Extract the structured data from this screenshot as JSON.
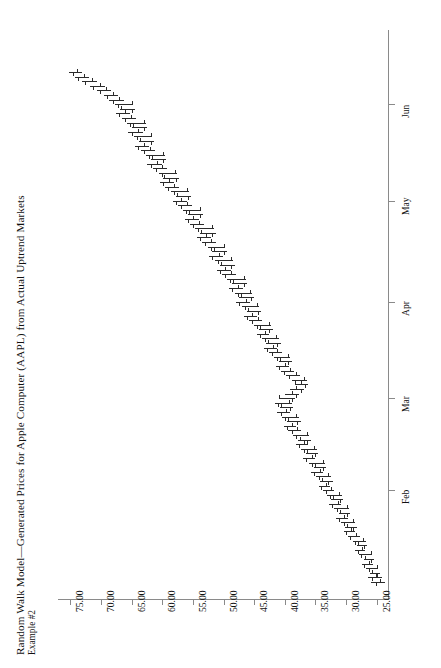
{
  "chart_data": {
    "type": "ohlc",
    "title": "Random Walk Model—Generated Prices for Apple Computer (AAPL) from Actual Uptrend Markets",
    "subtitle": "Example #2",
    "orientation": "rotated-90-ccw",
    "xlabel": "",
    "ylabel": "",
    "grid": false,
    "legend": null,
    "price_axis": {
      "ticks": [
        75.0,
        70.0,
        65.0,
        60.0,
        55.0,
        50.0,
        45.0,
        40.0,
        35.0,
        30.0,
        25.0
      ],
      "tick_labels": [
        "75.00",
        "70.00",
        "65.00",
        "60.00",
        "55.00",
        "50.00",
        "45.00",
        "40.00",
        "35.00",
        "30.00",
        "25.00"
      ],
      "min": 23.0,
      "max": 77.0,
      "format": "0.00"
    },
    "time_axis": {
      "tick_labels": [
        "Feb",
        "Mar",
        "Apr",
        "May",
        "Jun"
      ],
      "tick_index": [
        20,
        40,
        61,
        83,
        104
      ],
      "n_bars": 112
    },
    "bars": [
      {
        "i": 0,
        "h": 25.9,
        "l": 23.6,
        "o": 24.4,
        "c": 25.2
      },
      {
        "i": 1,
        "h": 26.4,
        "l": 24.2,
        "o": 25.1,
        "c": 25.8
      },
      {
        "i": 2,
        "h": 26.1,
        "l": 24.5,
        "o": 25.7,
        "c": 24.9
      },
      {
        "i": 3,
        "h": 26.8,
        "l": 24.8,
        "o": 25.0,
        "c": 26.3
      },
      {
        "i": 4,
        "h": 27.4,
        "l": 25.6,
        "o": 26.2,
        "c": 27.0
      },
      {
        "i": 5,
        "h": 27.1,
        "l": 25.4,
        "o": 26.9,
        "c": 25.9
      },
      {
        "i": 6,
        "h": 27.9,
        "l": 25.7,
        "o": 26.0,
        "c": 27.5
      },
      {
        "i": 7,
        "h": 28.6,
        "l": 26.9,
        "o": 27.4,
        "c": 28.1
      },
      {
        "i": 8,
        "h": 28.3,
        "l": 26.6,
        "o": 28.0,
        "c": 27.1
      },
      {
        "i": 9,
        "h": 28.9,
        "l": 26.8,
        "o": 27.2,
        "c": 28.5
      },
      {
        "i": 10,
        "h": 29.7,
        "l": 27.8,
        "o": 28.4,
        "c": 29.3
      },
      {
        "i": 11,
        "h": 30.4,
        "l": 28.6,
        "o": 29.2,
        "c": 30.0
      },
      {
        "i": 12,
        "h": 30.1,
        "l": 28.3,
        "o": 29.9,
        "c": 28.8
      },
      {
        "i": 13,
        "h": 30.9,
        "l": 28.5,
        "o": 28.9,
        "c": 30.4
      },
      {
        "i": 14,
        "h": 31.6,
        "l": 29.7,
        "o": 30.3,
        "c": 31.2
      },
      {
        "i": 15,
        "h": 31.2,
        "l": 29.3,
        "o": 31.0,
        "c": 29.8
      },
      {
        "i": 16,
        "h": 32.0,
        "l": 29.5,
        "o": 29.9,
        "c": 31.5
      },
      {
        "i": 17,
        "h": 32.8,
        "l": 30.9,
        "o": 31.4,
        "c": 32.3
      },
      {
        "i": 18,
        "h": 32.4,
        "l": 30.5,
        "o": 32.2,
        "c": 31.0
      },
      {
        "i": 19,
        "h": 33.1,
        "l": 30.7,
        "o": 31.1,
        "c": 32.6
      },
      {
        "i": 20,
        "h": 33.8,
        "l": 31.9,
        "o": 32.5,
        "c": 33.3
      },
      {
        "i": 21,
        "h": 34.5,
        "l": 32.6,
        "o": 33.2,
        "c": 34.1
      },
      {
        "i": 22,
        "h": 34.2,
        "l": 32.2,
        "o": 34.0,
        "c": 32.9
      },
      {
        "i": 23,
        "h": 34.9,
        "l": 32.4,
        "o": 33.0,
        "c": 34.4
      },
      {
        "i": 24,
        "h": 35.7,
        "l": 33.7,
        "o": 34.3,
        "c": 35.2
      },
      {
        "i": 25,
        "h": 35.3,
        "l": 33.2,
        "o": 35.1,
        "c": 33.7
      },
      {
        "i": 26,
        "h": 36.1,
        "l": 33.4,
        "o": 33.8,
        "c": 35.6
      },
      {
        "i": 27,
        "h": 37.0,
        "l": 35.0,
        "o": 35.5,
        "c": 36.5
      },
      {
        "i": 28,
        "h": 36.6,
        "l": 34.5,
        "o": 36.4,
        "c": 35.1
      },
      {
        "i": 29,
        "h": 37.4,
        "l": 34.8,
        "o": 35.2,
        "c": 36.9
      },
      {
        "i": 30,
        "h": 38.2,
        "l": 36.2,
        "o": 36.8,
        "c": 37.7
      },
      {
        "i": 31,
        "h": 37.8,
        "l": 35.7,
        "o": 37.6,
        "c": 36.3
      },
      {
        "i": 32,
        "h": 38.6,
        "l": 36.0,
        "o": 36.4,
        "c": 38.1
      },
      {
        "i": 33,
        "h": 39.4,
        "l": 37.4,
        "o": 38.0,
        "c": 38.9
      },
      {
        "i": 34,
        "h": 40.1,
        "l": 38.1,
        "o": 38.8,
        "c": 39.6
      },
      {
        "i": 35,
        "h": 39.6,
        "l": 37.4,
        "o": 39.4,
        "c": 38.0
      },
      {
        "i": 36,
        "h": 40.4,
        "l": 37.7,
        "o": 38.1,
        "c": 39.9
      },
      {
        "i": 37,
        "h": 41.2,
        "l": 39.2,
        "o": 39.8,
        "c": 40.7
      },
      {
        "i": 38,
        "h": 40.8,
        "l": 38.6,
        "o": 40.6,
        "c": 39.2
      },
      {
        "i": 39,
        "h": 41.6,
        "l": 38.9,
        "o": 39.3,
        "c": 41.1
      },
      {
        "i": 40,
        "h": 40.9,
        "l": 38.4,
        "o": 41.0,
        "c": 38.9
      },
      {
        "i": 41,
        "h": 40.0,
        "l": 37.6,
        "o": 38.8,
        "c": 38.2
      },
      {
        "i": 42,
        "h": 39.2,
        "l": 36.9,
        "o": 38.1,
        "c": 37.4
      },
      {
        "i": 43,
        "h": 38.4,
        "l": 36.2,
        "o": 37.3,
        "c": 36.7
      },
      {
        "i": 44,
        "h": 38.9,
        "l": 36.4,
        "o": 36.8,
        "c": 38.3
      },
      {
        "i": 45,
        "h": 39.8,
        "l": 37.6,
        "o": 38.2,
        "c": 39.3
      },
      {
        "i": 46,
        "h": 40.6,
        "l": 38.5,
        "o": 39.2,
        "c": 40.1
      },
      {
        "i": 47,
        "h": 41.4,
        "l": 39.3,
        "o": 40.0,
        "c": 40.9
      },
      {
        "i": 48,
        "h": 41.0,
        "l": 38.8,
        "o": 40.8,
        "c": 39.4
      },
      {
        "i": 49,
        "h": 41.8,
        "l": 39.1,
        "o": 39.5,
        "c": 41.3
      },
      {
        "i": 50,
        "h": 42.6,
        "l": 40.5,
        "o": 41.2,
        "c": 42.1
      },
      {
        "i": 51,
        "h": 43.4,
        "l": 41.3,
        "o": 42.0,
        "c": 42.9
      },
      {
        "i": 52,
        "h": 43.0,
        "l": 40.7,
        "o": 42.8,
        "c": 41.3
      },
      {
        "i": 53,
        "h": 43.8,
        "l": 41.0,
        "o": 41.4,
        "c": 43.3
      },
      {
        "i": 54,
        "h": 44.6,
        "l": 42.5,
        "o": 43.2,
        "c": 44.1
      },
      {
        "i": 55,
        "h": 44.2,
        "l": 41.9,
        "o": 44.0,
        "c": 42.5
      },
      {
        "i": 56,
        "h": 45.0,
        "l": 42.2,
        "o": 42.6,
        "c": 44.5
      },
      {
        "i": 57,
        "h": 45.9,
        "l": 43.7,
        "o": 44.4,
        "c": 45.4
      },
      {
        "i": 58,
        "h": 46.7,
        "l": 44.5,
        "o": 45.3,
        "c": 46.2
      },
      {
        "i": 59,
        "h": 46.2,
        "l": 43.9,
        "o": 46.0,
        "c": 44.4
      },
      {
        "i": 60,
        "h": 47.0,
        "l": 44.2,
        "o": 44.5,
        "c": 46.5
      },
      {
        "i": 61,
        "h": 47.9,
        "l": 45.7,
        "o": 46.4,
        "c": 47.4
      },
      {
        "i": 62,
        "h": 47.4,
        "l": 45.0,
        "o": 47.2,
        "c": 45.5
      },
      {
        "i": 63,
        "h": 48.2,
        "l": 45.3,
        "o": 45.6,
        "c": 47.7
      },
      {
        "i": 64,
        "h": 49.1,
        "l": 46.8,
        "o": 47.6,
        "c": 48.6
      },
      {
        "i": 65,
        "h": 48.6,
        "l": 46.1,
        "o": 48.4,
        "c": 46.6
      },
      {
        "i": 66,
        "h": 49.4,
        "l": 46.4,
        "o": 46.7,
        "c": 48.9
      },
      {
        "i": 67,
        "h": 50.3,
        "l": 48.0,
        "o": 48.8,
        "c": 49.8
      },
      {
        "i": 68,
        "h": 51.1,
        "l": 48.8,
        "o": 49.7,
        "c": 50.6
      },
      {
        "i": 69,
        "h": 50.6,
        "l": 48.2,
        "o": 50.4,
        "c": 48.7
      },
      {
        "i": 70,
        "h": 51.4,
        "l": 48.5,
        "o": 48.8,
        "c": 50.9
      },
      {
        "i": 71,
        "h": 52.3,
        "l": 50.0,
        "o": 50.8,
        "c": 51.8
      },
      {
        "i": 72,
        "h": 51.8,
        "l": 49.4,
        "o": 51.6,
        "c": 49.9
      },
      {
        "i": 73,
        "h": 52.6,
        "l": 49.7,
        "o": 50.0,
        "c": 52.1
      },
      {
        "i": 74,
        "h": 53.5,
        "l": 51.2,
        "o": 52.0,
        "c": 53.0
      },
      {
        "i": 75,
        "h": 54.3,
        "l": 52.0,
        "o": 52.9,
        "c": 53.8
      },
      {
        "i": 76,
        "h": 53.8,
        "l": 51.3,
        "o": 53.6,
        "c": 51.8
      },
      {
        "i": 77,
        "h": 54.6,
        "l": 51.6,
        "o": 51.9,
        "c": 54.1
      },
      {
        "i": 78,
        "h": 55.5,
        "l": 53.2,
        "o": 54.0,
        "c": 55.0
      },
      {
        "i": 79,
        "h": 56.3,
        "l": 54.0,
        "o": 54.9,
        "c": 55.8
      },
      {
        "i": 80,
        "h": 55.8,
        "l": 53.3,
        "o": 55.6,
        "c": 53.8
      },
      {
        "i": 81,
        "h": 56.6,
        "l": 53.6,
        "o": 53.9,
        "c": 56.1
      },
      {
        "i": 82,
        "h": 57.5,
        "l": 55.2,
        "o": 56.0,
        "c": 57.0
      },
      {
        "i": 83,
        "h": 58.3,
        "l": 56.0,
        "o": 56.9,
        "c": 57.8
      },
      {
        "i": 84,
        "h": 57.8,
        "l": 55.3,
        "o": 57.6,
        "c": 55.8
      },
      {
        "i": 85,
        "h": 58.6,
        "l": 55.6,
        "o": 55.9,
        "c": 58.1
      },
      {
        "i": 86,
        "h": 59.5,
        "l": 57.2,
        "o": 58.0,
        "c": 59.0
      },
      {
        "i": 87,
        "h": 60.4,
        "l": 58.1,
        "o": 58.9,
        "c": 59.9
      },
      {
        "i": 88,
        "h": 59.8,
        "l": 57.3,
        "o": 59.7,
        "c": 57.8
      },
      {
        "i": 89,
        "h": 60.6,
        "l": 57.6,
        "o": 57.9,
        "c": 60.1
      },
      {
        "i": 90,
        "h": 61.5,
        "l": 59.2,
        "o": 60.0,
        "c": 61.0
      },
      {
        "i": 91,
        "h": 62.4,
        "l": 60.1,
        "o": 60.9,
        "c": 61.9
      },
      {
        "i": 92,
        "h": 61.8,
        "l": 59.3,
        "o": 61.7,
        "c": 59.8
      },
      {
        "i": 93,
        "h": 62.6,
        "l": 59.6,
        "o": 59.9,
        "c": 62.1
      },
      {
        "i": 94,
        "h": 63.5,
        "l": 61.2,
        "o": 62.0,
        "c": 63.0
      },
      {
        "i": 95,
        "h": 64.4,
        "l": 62.1,
        "o": 62.9,
        "c": 63.9
      },
      {
        "i": 96,
        "h": 63.8,
        "l": 61.3,
        "o": 63.7,
        "c": 61.8
      },
      {
        "i": 97,
        "h": 64.6,
        "l": 61.6,
        "o": 61.9,
        "c": 64.1
      },
      {
        "i": 98,
        "h": 65.5,
        "l": 63.2,
        "o": 64.0,
        "c": 65.0
      },
      {
        "i": 99,
        "h": 64.9,
        "l": 62.4,
        "o": 64.8,
        "c": 62.9
      },
      {
        "i": 100,
        "h": 65.7,
        "l": 62.7,
        "o": 63.0,
        "c": 65.2
      },
      {
        "i": 101,
        "h": 66.6,
        "l": 64.3,
        "o": 65.1,
        "c": 66.1
      },
      {
        "i": 102,
        "h": 67.5,
        "l": 65.2,
        "o": 66.0,
        "c": 67.0
      },
      {
        "i": 103,
        "h": 66.9,
        "l": 64.4,
        "o": 66.8,
        "c": 64.9
      },
      {
        "i": 104,
        "h": 67.7,
        "l": 64.7,
        "o": 65.0,
        "c": 67.2
      },
      {
        "i": 105,
        "h": 68.6,
        "l": 66.3,
        "o": 67.1,
        "c": 68.1
      },
      {
        "i": 106,
        "h": 69.5,
        "l": 67.2,
        "o": 68.0,
        "c": 69.0
      },
      {
        "i": 107,
        "h": 70.6,
        "l": 68.3,
        "o": 69.1,
        "c": 70.1
      },
      {
        "i": 108,
        "h": 71.8,
        "l": 69.4,
        "o": 70.2,
        "c": 71.3
      },
      {
        "i": 109,
        "h": 73.1,
        "l": 70.7,
        "o": 71.4,
        "c": 72.6
      },
      {
        "i": 110,
        "h": 74.3,
        "l": 72.0,
        "o": 72.7,
        "c": 73.8
      },
      {
        "i": 111,
        "h": 75.2,
        "l": 73.1,
        "o": 73.9,
        "c": 74.6
      }
    ]
  },
  "colors": {
    "bar": "#2b2b2b",
    "axis": "#8a8a8a",
    "text": "#111111",
    "background": "#ffffff"
  }
}
